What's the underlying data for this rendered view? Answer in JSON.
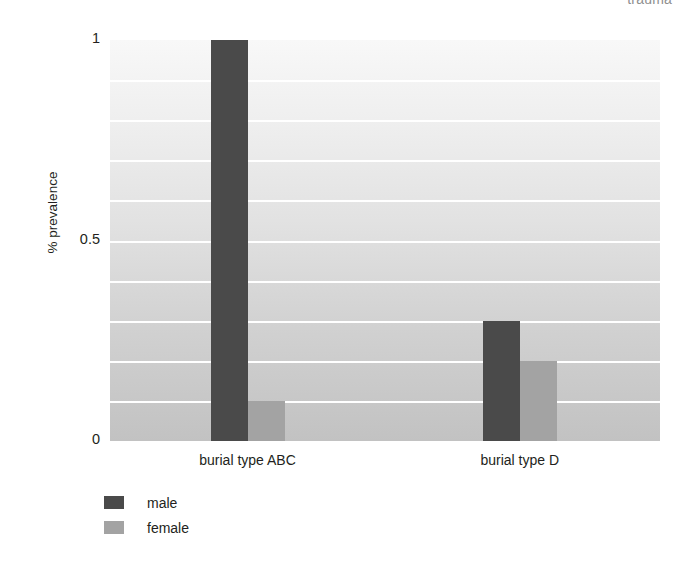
{
  "chart_data": {
    "type": "bar",
    "title": "trauma",
    "xlabel": "",
    "ylabel": "% prevalence",
    "categories": [
      "burial type ABC",
      "burial type D"
    ],
    "series": [
      {
        "name": "male",
        "color": "#4a4a4a",
        "values": [
          1.0,
          0.3
        ]
      },
      {
        "name": "female",
        "color": "#a3a3a3",
        "values": [
          0.1,
          0.2
        ]
      }
    ],
    "ylim": [
      0,
      1
    ],
    "y_tick_values": [
      0,
      0.5,
      1
    ],
    "y_tick_labels": [
      "0",
      "0.5",
      "1"
    ],
    "gridlines_at": [
      0.1,
      0.2,
      0.3,
      0.4,
      0.5,
      0.6,
      0.7,
      0.8,
      0.9
    ],
    "grid": true,
    "legend_position": "below-left",
    "plot_background_top": "#f8f8f8",
    "plot_background_bottom": "#c2c2c2",
    "gridline_color": "#ffffff"
  }
}
